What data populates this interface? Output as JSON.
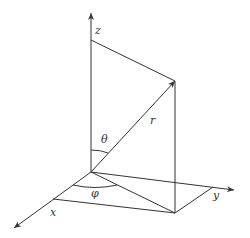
{
  "diagram": {
    "labels": {
      "z": "z",
      "x": "x",
      "y": "y",
      "r": "r",
      "theta": "θ",
      "phi": "φ"
    },
    "colors": {
      "stroke": "#333333",
      "background": "#ffffff"
    }
  }
}
